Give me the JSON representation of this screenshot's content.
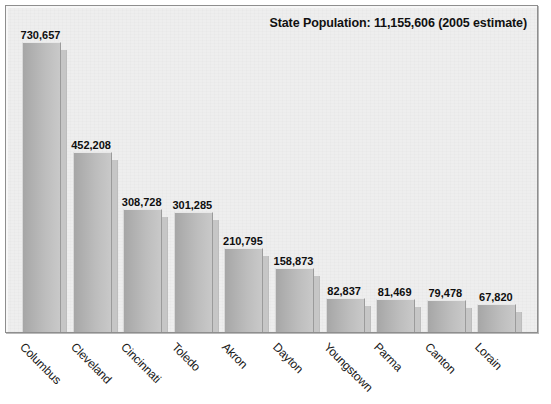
{
  "chart_data": {
    "type": "bar",
    "title": "State Population: 11,155,606 (2005 estimate)",
    "xlabel": "",
    "ylabel": "",
    "ylim": [
      0,
      760000
    ],
    "grid": false,
    "legend": null,
    "orientation": "vertical",
    "value_labels_shown": true,
    "categories": [
      "Columbus",
      "Cleveland",
      "Cincinnati",
      "Toledo",
      "Akron",
      "Dayton",
      "Youngstown",
      "Parma",
      "Canton",
      "Lorain"
    ],
    "values": [
      730657,
      452208,
      308728,
      301285,
      210795,
      158873,
      82837,
      81469,
      79478,
      67820
    ],
    "value_labels": [
      "730,657",
      "452,208",
      "308,728",
      "301,285",
      "210,795",
      "158,873",
      "82,837",
      "81,469",
      "79,478",
      "67,820"
    ],
    "annotations": [
      {
        "text": "State Population: 11,155,606 (2005 estimate)",
        "position": "top-right"
      }
    ]
  },
  "colors": {
    "page_background": "#ffffff",
    "panel_background": "#eeeeee",
    "panel_border": "#8e8e8e",
    "bar_fill_dark": "#a6a6a6",
    "bar_fill_light": "#c9c9c9",
    "bar_shadow": "#c6c6c6",
    "text": "#111111"
  }
}
